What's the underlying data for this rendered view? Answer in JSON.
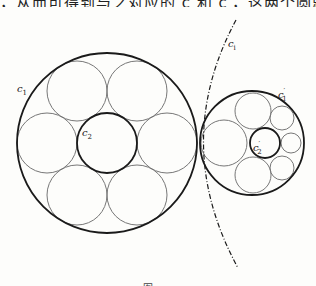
{
  "top_text": "，从而可得到与之对应的 c 和 c′，这两个圆就满足该结论的条件，反过来亦然，",
  "bottom_caption": "图",
  "labels": {
    "c1": {
      "main": "c",
      "sub": "1",
      "prime": ""
    },
    "c2": {
      "main": "c",
      "sub": "2",
      "prime": ""
    },
    "c1_prime": {
      "main": "c",
      "sub": "1",
      "prime": "′"
    },
    "c2_prime": {
      "main": "c",
      "sub": "2",
      "prime": "′"
    },
    "ci": {
      "main": "c",
      "sub": "i",
      "prime": ""
    }
  },
  "colors": {
    "thick_stroke": "#1a1a1a",
    "thin_stroke": "#777777",
    "background": "#fdfdfb"
  },
  "geometry": {
    "c1": {
      "cx": 107,
      "cy": 143,
      "r": 90
    },
    "c2": {
      "cx": 107,
      "cy": 143,
      "r": 30
    },
    "ring_left": [
      {
        "cx": 137,
        "cy": 91,
        "r": 30
      },
      {
        "cx": 167,
        "cy": 143,
        "r": 30
      },
      {
        "cx": 137,
        "cy": 195,
        "r": 30
      },
      {
        "cx": 77,
        "cy": 195,
        "r": 30
      },
      {
        "cx": 47,
        "cy": 143,
        "r": 30
      },
      {
        "cx": 77,
        "cy": 91,
        "r": 30
      }
    ],
    "c1_prime": {
      "cx": 252,
      "cy": 143,
      "r": 52
    },
    "c2_prime": {
      "cx": 265,
      "cy": 143,
      "r": 15
    },
    "ring_right": [
      {
        "cx": 224,
        "cy": 143,
        "r": 23
      },
      {
        "cx": 253,
        "cy": 111,
        "r": 18
      },
      {
        "cx": 282,
        "cy": 118,
        "r": 12
      },
      {
        "cx": 291,
        "cy": 143,
        "r": 10
      },
      {
        "cx": 282,
        "cy": 168,
        "r": 12
      },
      {
        "cx": 253,
        "cy": 175,
        "r": 18
      }
    ],
    "inversion_circle_ci": {
      "path": "M 236 20 Q 170 143 238 268"
    }
  }
}
